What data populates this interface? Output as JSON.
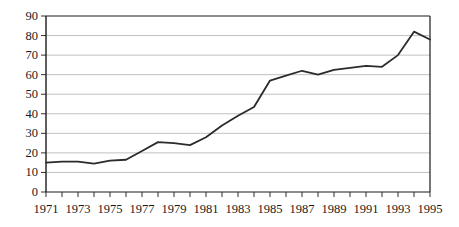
{
  "chart_data": {
    "type": "line",
    "title": "",
    "subtitle": "",
    "xlabel": "",
    "ylabel": "",
    "xlim": [
      1971,
      1995
    ],
    "ylim": [
      0,
      90
    ],
    "grid": true,
    "grid_axis": "y",
    "legend": false,
    "legend_position": "none",
    "line_color": "#2b2b2b",
    "grid_color": "#b0b0b0",
    "axis_color": "#1a1a1a",
    "x": [
      1971,
      1972,
      1973,
      1974,
      1975,
      1976,
      1977,
      1978,
      1979,
      1980,
      1981,
      1982,
      1983,
      1984,
      1985,
      1986,
      1987,
      1988,
      1989,
      1990,
      1991,
      1992,
      1993,
      1994,
      1995
    ],
    "values": [
      15,
      15.5,
      15.5,
      14.5,
      16,
      16.5,
      21,
      25.5,
      25,
      24,
      28,
      34,
      39,
      43.5,
      57,
      59.5,
      62,
      60,
      62.5,
      63.5,
      64.5,
      64,
      70,
      82,
      78
    ],
    "y_ticks": [
      0,
      10,
      20,
      30,
      40,
      50,
      60,
      70,
      80,
      90
    ],
    "y_tick_labels": [
      "0",
      "10",
      "20",
      "30",
      "40",
      "50",
      "60",
      "70",
      "80",
      "90"
    ],
    "x_ticks": [
      1971,
      1972,
      1973,
      1974,
      1975,
      1976,
      1977,
      1978,
      1979,
      1980,
      1981,
      1982,
      1983,
      1984,
      1985,
      1986,
      1987,
      1988,
      1989,
      1990,
      1991,
      1992,
      1993,
      1994,
      1995
    ],
    "x_tick_labels": [
      "1971",
      "",
      "1973",
      "",
      "1975",
      "",
      "1977",
      "",
      "1979",
      "",
      "1981",
      "",
      "1983",
      "",
      "1985",
      "",
      "1987",
      "",
      "1989",
      "",
      "1991",
      "",
      "1993",
      "",
      "1995"
    ]
  }
}
